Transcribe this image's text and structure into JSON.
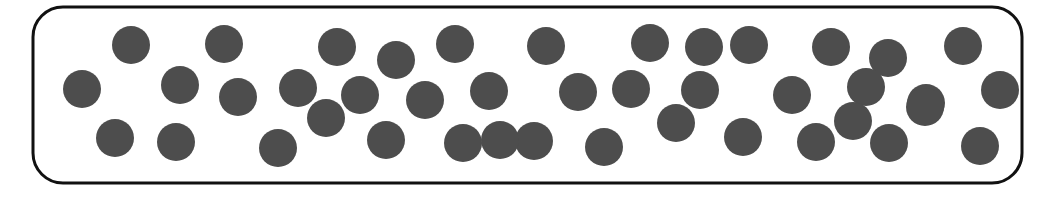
{
  "figure": {
    "canvas": {
      "width": 1053,
      "height": 200
    },
    "background_color": "#ffffff"
  },
  "container": {
    "name": "rounded-rectangle-container",
    "x": 33,
    "y": 7,
    "width": 989,
    "height": 176,
    "corner_radius": 30,
    "stroke_color": "#111111",
    "stroke_width": 3,
    "fill_color": "#ffffff"
  },
  "particles": {
    "name": "particle-set",
    "count": 42,
    "radius": 19,
    "fill_color": "#4d4d4d",
    "items": [
      {
        "cx": 131,
        "cy": 45
      },
      {
        "cx": 224,
        "cy": 44
      },
      {
        "cx": 337,
        "cy": 47
      },
      {
        "cx": 396,
        "cy": 60
      },
      {
        "cx": 455,
        "cy": 44
      },
      {
        "cx": 546,
        "cy": 46
      },
      {
        "cx": 650,
        "cy": 43
      },
      {
        "cx": 749,
        "cy": 45
      },
      {
        "cx": 831,
        "cy": 47
      },
      {
        "cx": 888,
        "cy": 58
      },
      {
        "cx": 963,
        "cy": 46
      },
      {
        "cx": 82,
        "cy": 89
      },
      {
        "cx": 180,
        "cy": 85
      },
      {
        "cx": 238,
        "cy": 97
      },
      {
        "cx": 298,
        "cy": 88
      },
      {
        "cx": 425,
        "cy": 100
      },
      {
        "cx": 489,
        "cy": 91
      },
      {
        "cx": 578,
        "cy": 92
      },
      {
        "cx": 631,
        "cy": 89
      },
      {
        "cx": 700,
        "cy": 90
      },
      {
        "cx": 792,
        "cy": 95
      },
      {
        "cx": 866,
        "cy": 87
      },
      {
        "cx": 926,
        "cy": 103
      },
      {
        "cx": 326,
        "cy": 118
      },
      {
        "cx": 676,
        "cy": 123
      },
      {
        "cx": 853,
        "cy": 121
      },
      {
        "cx": 115,
        "cy": 138
      },
      {
        "cx": 176,
        "cy": 142
      },
      {
        "cx": 278,
        "cy": 148
      },
      {
        "cx": 386,
        "cy": 140
      },
      {
        "cx": 463,
        "cy": 143
      },
      {
        "cx": 534,
        "cy": 141
      },
      {
        "cx": 604,
        "cy": 147
      },
      {
        "cx": 743,
        "cy": 137
      },
      {
        "cx": 816,
        "cy": 142
      },
      {
        "cx": 889,
        "cy": 143
      },
      {
        "cx": 925,
        "cy": 107
      },
      {
        "cx": 980,
        "cy": 146
      },
      {
        "cx": 1000,
        "cy": 90
      },
      {
        "cx": 704,
        "cy": 47
      },
      {
        "cx": 500,
        "cy": 140
      },
      {
        "cx": 360,
        "cy": 95
      }
    ]
  }
}
